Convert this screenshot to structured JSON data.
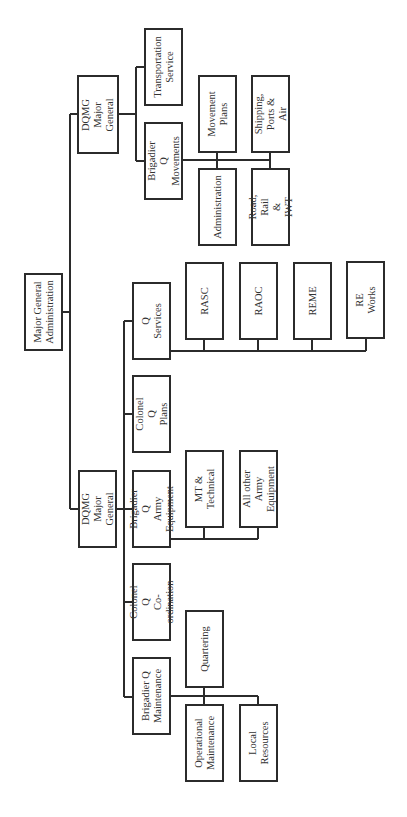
{
  "chart_data": {
    "type": "org-chart",
    "orientation": "rotated-90-ccw",
    "root": {
      "label": "Major General\nAdministration",
      "children": [
        {
          "label": "DQMG\nMajor General",
          "children": [
            {
              "label": "Transportation\nService",
              "children": []
            },
            {
              "label": "Brigadier Q\nMovements",
              "children": [
                {
                  "label": "Movement\nPlans"
                },
                {
                  "label": "Shipping, Ports &\nAir"
                },
                {
                  "label": "Administration"
                },
                {
                  "label": "Road, Rail & IWT"
                }
              ]
            }
          ]
        },
        {
          "label": "DQMG\nMajor General",
          "children": [
            {
              "label": "Q Services",
              "children": [
                {
                  "label": "RASC"
                },
                {
                  "label": "RAOC"
                },
                {
                  "label": "REME"
                },
                {
                  "label": "RE Works"
                }
              ]
            },
            {
              "label": "Colonel Q\nPlans",
              "children": []
            },
            {
              "label": "Brigadier Q\nArmy Equipment",
              "children": [
                {
                  "label": "MT & Technical"
                },
                {
                  "label": "All other Army\nEquipment"
                }
              ]
            },
            {
              "label": "Colonel Q\nCo-ordination",
              "children": []
            },
            {
              "label": "Brigadier Q\nMaintenance",
              "children": [
                {
                  "label": "Quartering"
                },
                {
                  "label": "Operational\nMaintenance"
                },
                {
                  "label": "Local Resources"
                }
              ]
            }
          ]
        }
      ]
    }
  },
  "style": {
    "line_color": "#2b2b2b",
    "box_border": "#2b2b2b",
    "background": "#ffffff"
  },
  "nodes": [
    {
      "id": "mga",
      "label": "Major General\nAdministration",
      "x": 24,
      "y": 273,
      "w": 39,
      "h": 78
    },
    {
      "id": "dqmg-top",
      "label": "DQMG\nMajor General",
      "x": 77,
      "y": 75,
      "w": 42,
      "h": 79
    },
    {
      "id": "transport",
      "label": "Transportation\nService",
      "x": 144,
      "y": 28,
      "w": 39,
      "h": 78
    },
    {
      "id": "bq-move",
      "label": "Brigadier Q\nMovements",
      "x": 144,
      "y": 122,
      "w": 39,
      "h": 78
    },
    {
      "id": "move-plans",
      "label": "Movement\nPlans",
      "x": 198,
      "y": 75,
      "w": 39,
      "h": 78
    },
    {
      "id": "shipping",
      "label": "Shipping, Ports &\nAir",
      "x": 251,
      "y": 75,
      "w": 39,
      "h": 78
    },
    {
      "id": "admin",
      "label": "Administration",
      "x": 198,
      "y": 168,
      "w": 39,
      "h": 78
    },
    {
      "id": "road-rail",
      "label": "Road, Rail & IWT",
      "x": 251,
      "y": 168,
      "w": 39,
      "h": 78
    },
    {
      "id": "q-services",
      "label": "Q Services",
      "x": 132,
      "y": 282,
      "w": 39,
      "h": 78
    },
    {
      "id": "rasc",
      "label": "RASC",
      "x": 185,
      "y": 262,
      "w": 39,
      "h": 78
    },
    {
      "id": "raoc",
      "label": "RAOC",
      "x": 239,
      "y": 262,
      "w": 39,
      "h": 78
    },
    {
      "id": "reme",
      "label": "REME",
      "x": 293,
      "y": 262,
      "w": 39,
      "h": 78
    },
    {
      "id": "re-works",
      "label": "RE Works",
      "x": 346,
      "y": 261,
      "w": 39,
      "h": 78
    },
    {
      "id": "cq-plans",
      "label": "Colonel Q\nPlans",
      "x": 132,
      "y": 375,
      "w": 39,
      "h": 78
    },
    {
      "id": "dqmg-low",
      "label": "DQMG\nMajor General",
      "x": 78,
      "y": 470,
      "w": 39,
      "h": 78
    },
    {
      "id": "bq-equip",
      "label": "Brigadier Q\nArmy Equipment",
      "x": 132,
      "y": 470,
      "w": 39,
      "h": 78
    },
    {
      "id": "mt-tech",
      "label": "MT & Technical",
      "x": 185,
      "y": 450,
      "w": 39,
      "h": 78
    },
    {
      "id": "all-other",
      "label": "All other Army\nEquipment",
      "x": 239,
      "y": 450,
      "w": 39,
      "h": 78
    },
    {
      "id": "cq-coord",
      "label": "Colonel Q\nCo-ordination",
      "x": 132,
      "y": 563,
      "w": 39,
      "h": 78
    },
    {
      "id": "quartering",
      "label": "Quartering",
      "x": 185,
      "y": 610,
      "w": 39,
      "h": 78
    },
    {
      "id": "bq-maint",
      "label": "Brigadier Q\nMaintenance",
      "x": 132,
      "y": 657,
      "w": 39,
      "h": 78
    },
    {
      "id": "op-maint",
      "label": "Operational\nMaintenance",
      "x": 185,
      "y": 704,
      "w": 39,
      "h": 78
    },
    {
      "id": "local-res",
      "label": "Local Resources",
      "x": 239,
      "y": 704,
      "w": 39,
      "h": 78
    }
  ],
  "lines": [
    "M63 312 H70",
    "M70 114 V509",
    "M70 114 H77",
    "M70 509 H78",
    "M119 114 H136",
    "M136 67 V161",
    "M136 67 H144",
    "M136 161 H144",
    "M183 160 H270",
    "M217 153 V168",
    "M270 153 V168",
    "M117 509 H124",
    "M124 321 V697",
    "M124 321 H132",
    "M124 414 H132",
    "M124 509 H132",
    "M124 602 H132",
    "M124 697 H132",
    "M171 351 H366",
    "M204 340 V351",
    "M258 340 V351",
    "M312 340 V351",
    "M366 339 V351",
    "M171 539 H258",
    "M204 528 V539",
    "M258 528 V539",
    "M171 696 H258",
    "M204 688 V704",
    "M258 696 V704"
  ]
}
